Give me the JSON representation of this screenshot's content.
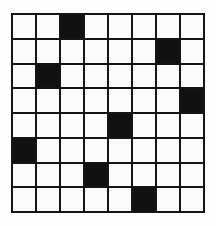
{
  "figure": {
    "rows": 8,
    "columns": 8,
    "cell_state_empty": "empty",
    "cell_state_filled": "filled"
  },
  "colors": {
    "background": "#ffffff",
    "paper": "#fdfdfd",
    "grid_line": "#151515",
    "cell_empty": "#fbfbfb",
    "cell_filled": "#111111"
  },
  "chart_data": {
    "type": "heatmap",
    "xlabel": "",
    "ylabel": "",
    "categories": [
      "1",
      "2",
      "3",
      "4",
      "5",
      "6",
      "7",
      "8"
    ],
    "row_labels": [
      "1",
      "2",
      "3",
      "4",
      "5",
      "6",
      "7",
      "8"
    ],
    "filled_column_by_row": [
      2,
      6,
      1,
      7,
      4,
      0,
      3,
      5
    ],
    "values": [
      [
        0,
        0,
        1,
        0,
        0,
        0,
        0,
        0
      ],
      [
        0,
        0,
        0,
        0,
        0,
        0,
        1,
        0
      ],
      [
        0,
        1,
        0,
        0,
        0,
        0,
        0,
        0
      ],
      [
        0,
        0,
        0,
        0,
        0,
        0,
        0,
        1
      ],
      [
        0,
        0,
        0,
        0,
        1,
        0,
        0,
        0
      ],
      [
        1,
        0,
        0,
        0,
        0,
        0,
        0,
        0
      ],
      [
        0,
        0,
        0,
        1,
        0,
        0,
        0,
        0
      ],
      [
        0,
        0,
        0,
        0,
        0,
        1,
        0,
        0
      ]
    ],
    "value_legend": {
      "0": "empty",
      "1": "filled"
    },
    "grid": true,
    "legend_position": "none"
  }
}
